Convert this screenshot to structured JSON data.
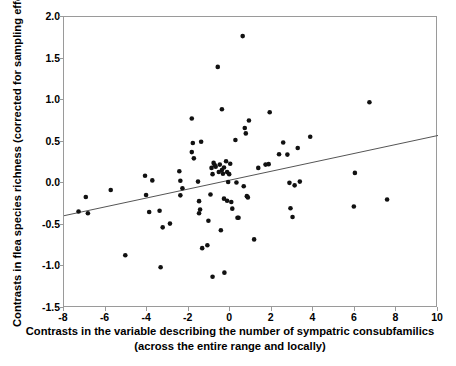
{
  "chart_data": {
    "type": "scatter",
    "title": "",
    "xlabel": "Contrasts in the variable describing the number of sympatric consubfamilics (across the entire range and locally)",
    "ylabel": "Contrasts in flea species richness (corrected for sampling effort)",
    "xlim": [
      -8,
      10
    ],
    "ylim": [
      -1.5,
      2.0
    ],
    "xticks": [
      -8,
      -6,
      -4,
      -2,
      0,
      2,
      4,
      6,
      8,
      10
    ],
    "xtick_labels": [
      "-8",
      "-6",
      "-4",
      "-2",
      "0",
      "2",
      "4",
      "6",
      "8",
      "10"
    ],
    "yticks": [
      -1.5,
      -1.0,
      -0.5,
      0.0,
      0.5,
      1.0,
      1.5,
      2.0
    ],
    "ytick_labels": [
      "-1.5",
      "-1.0",
      "-0.5",
      "0.0",
      "0.5",
      "1.0",
      "1.5",
      "2.0"
    ],
    "grid": false,
    "legend": false,
    "marker": "filled-circle",
    "marker_color": "#111111",
    "marker_size": 4.6,
    "frame_color": "#9a9a9a",
    "background": "#ffffff",
    "trendline": {
      "type": "linear",
      "color": "#555555",
      "width": 1,
      "x_start": -8,
      "y_start": -0.39,
      "x_end": 10,
      "y_end": 0.575
    },
    "points": [
      [
        -7.3,
        -0.34
      ],
      [
        -6.95,
        -0.165
      ],
      [
        -6.85,
        -0.36
      ],
      [
        -5.75,
        -0.08
      ],
      [
        -5.05,
        -0.865
      ],
      [
        -4.1,
        0.09
      ],
      [
        -4.05,
        -0.14
      ],
      [
        -3.9,
        -0.345
      ],
      [
        -3.75,
        0.035
      ],
      [
        -3.4,
        -0.33
      ],
      [
        -3.35,
        -1.01
      ],
      [
        -3.25,
        -0.53
      ],
      [
        -2.9,
        -0.485
      ],
      [
        -2.45,
        0.145
      ],
      [
        -2.4,
        0.03
      ],
      [
        -2.4,
        -0.145
      ],
      [
        -2.3,
        -0.06
      ],
      [
        -1.85,
        0.78
      ],
      [
        -1.85,
        0.375
      ],
      [
        -1.8,
        0.485
      ],
      [
        -1.75,
        0.3
      ],
      [
        -1.55,
        0.02
      ],
      [
        -1.5,
        -0.215
      ],
      [
        -1.5,
        -0.36
      ],
      [
        -1.45,
        -0.315
      ],
      [
        -1.4,
        0.5
      ],
      [
        -1.35,
        -0.78
      ],
      [
        -1.1,
        -0.745
      ],
      [
        -1.05,
        -0.45
      ],
      [
        -0.95,
        -0.135
      ],
      [
        -0.9,
        0.185
      ],
      [
        -0.85,
        0.11
      ],
      [
        -0.85,
        -1.125
      ],
      [
        -0.8,
        0.245
      ],
      [
        -0.75,
        0.22
      ],
      [
        -0.7,
        0.2
      ],
      [
        -0.6,
        1.4
      ],
      [
        -0.55,
        0.135
      ],
      [
        -0.5,
        0.225
      ],
      [
        -0.45,
        -0.565
      ],
      [
        -0.4,
        0.89
      ],
      [
        -0.4,
        0.16
      ],
      [
        -0.35,
        0.115
      ],
      [
        -0.3,
        0.19
      ],
      [
        -0.3,
        -0.185
      ],
      [
        -0.28,
        -1.075
      ],
      [
        -0.2,
        0.265
      ],
      [
        -0.15,
        0.135
      ],
      [
        -0.15,
        -0.21
      ],
      [
        -0.1,
        0.015
      ],
      [
        -0.05,
        0.11
      ],
      [
        0.0,
        0.235
      ],
      [
        0.05,
        -0.225
      ],
      [
        0.1,
        -0.305
      ],
      [
        0.25,
        0.52
      ],
      [
        0.3,
        0.01
      ],
      [
        0.35,
        -0.415
      ],
      [
        0.4,
        -0.415
      ],
      [
        0.6,
        1.77
      ],
      [
        0.65,
        -0.035
      ],
      [
        0.7,
        0.665
      ],
      [
        0.75,
        0.6
      ],
      [
        0.8,
        -0.155
      ],
      [
        0.85,
        -0.17
      ],
      [
        0.9,
        0.755
      ],
      [
        1.15,
        -0.675
      ],
      [
        1.35,
        0.185
      ],
      [
        1.7,
        0.225
      ],
      [
        1.85,
        0.23
      ],
      [
        1.9,
        0.855
      ],
      [
        2.35,
        0.35
      ],
      [
        2.55,
        0.49
      ],
      [
        2.75,
        0.345
      ],
      [
        2.85,
        0.005
      ],
      [
        2.9,
        -0.3
      ],
      [
        3.0,
        -0.405
      ],
      [
        3.1,
        -0.025
      ],
      [
        3.25,
        0.425
      ],
      [
        3.35,
        0.02
      ],
      [
        3.85,
        0.56
      ],
      [
        5.95,
        -0.28
      ],
      [
        6.0,
        0.125
      ],
      [
        6.7,
        0.975
      ],
      [
        7.55,
        -0.195
      ]
    ]
  }
}
